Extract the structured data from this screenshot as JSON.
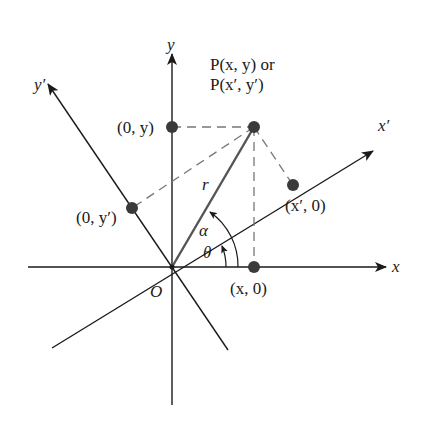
{
  "diagram": {
    "axes": {
      "x": "x",
      "y": "y",
      "x_prime": "x′",
      "y_prime": "y′"
    },
    "origin_label": "O",
    "point_label_line1": "P(x, y) or",
    "point_label_line2": "P(x′, y′)",
    "points": {
      "x0": "(x, 0)",
      "y0": "(0, y)",
      "xp0": "(x′, 0)",
      "yp0": "(0, y′)"
    },
    "segment_label": "r",
    "angles": {
      "alpha": "α",
      "theta": "θ"
    },
    "colors": {
      "line": "#1a1a1a",
      "vector": "#555555",
      "dashed": "#777777",
      "dot": "#3a3a3a"
    }
  }
}
